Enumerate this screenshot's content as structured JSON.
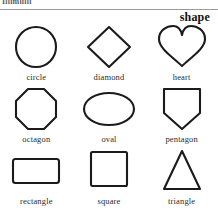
{
  "page": {
    "running_head_fragment": "Illlmlllll",
    "heading": "shape",
    "ink_color": "#1b1b1b",
    "background_color": "#ffffff",
    "rule_color": "#9a9a9a"
  },
  "grid": {
    "columns": 3,
    "rows": 3,
    "items": [
      {
        "label": "circle",
        "icon": "circle-shape-icon"
      },
      {
        "label": "diamond",
        "icon": "diamond-shape-icon"
      },
      {
        "label": "heart",
        "icon": "heart-shape-icon"
      },
      {
        "label": "octagon",
        "icon": "octagon-shape-icon"
      },
      {
        "label": "oval",
        "icon": "oval-shape-icon"
      },
      {
        "label": "pentagon",
        "icon": "pentagon-shape-icon"
      },
      {
        "label": "rectangle",
        "icon": "rectangle-shape-icon"
      },
      {
        "label": "square",
        "icon": "square-shape-icon"
      },
      {
        "label": "triangle",
        "icon": "triangle-shape-icon"
      }
    ]
  }
}
